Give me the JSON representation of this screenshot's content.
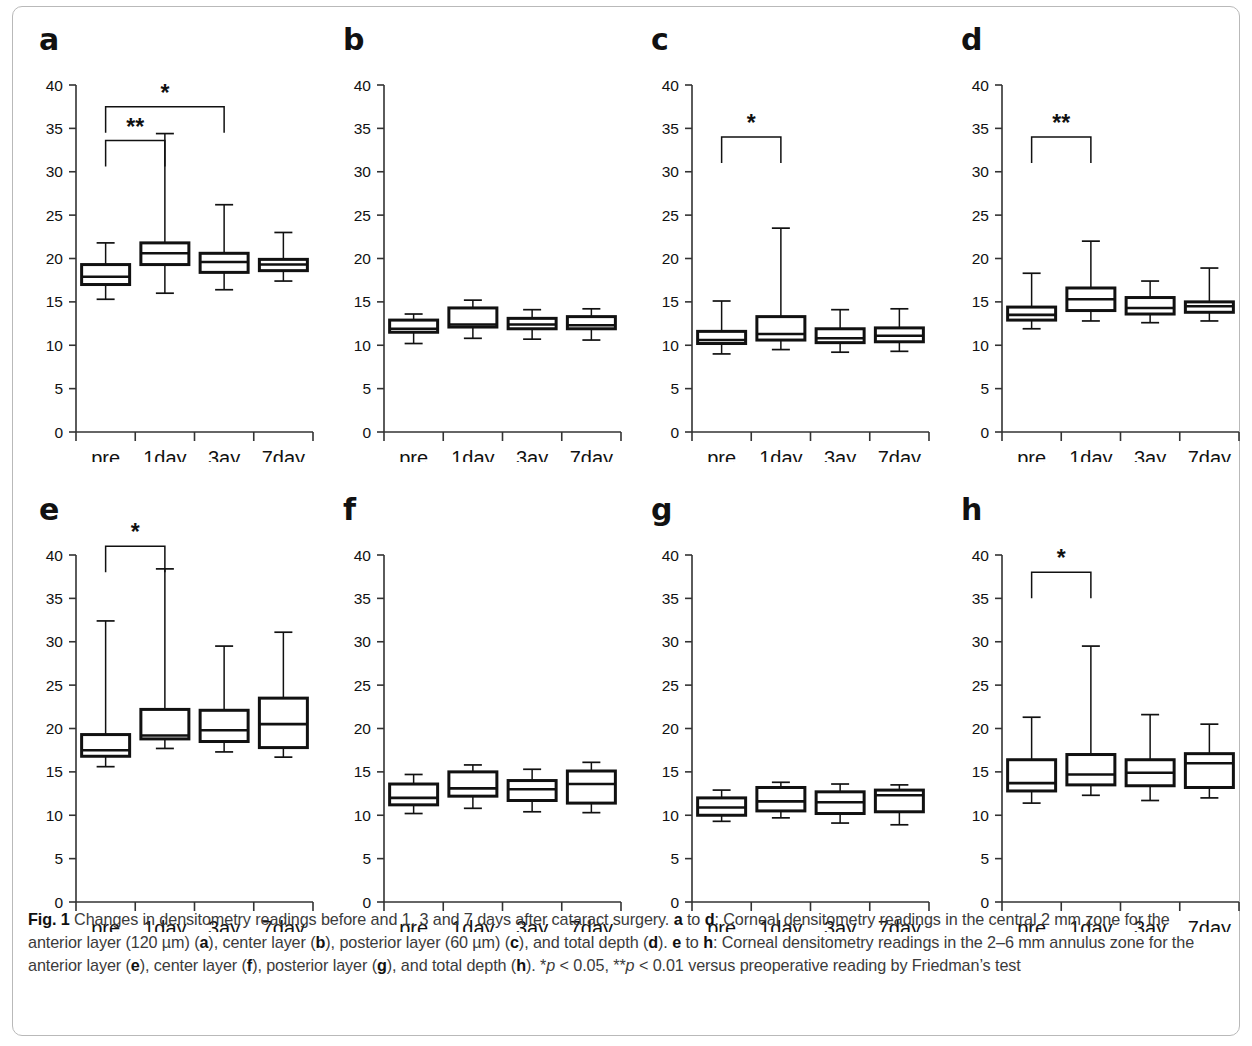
{
  "figure": {
    "label": "Fig. 1",
    "caption_parts": [
      {
        "t": "Fig. 1 ",
        "b": true
      },
      {
        "t": "Changes in densitometry readings before and 1, 3 and 7 days after cataract surgery. ",
        "b": false
      },
      {
        "t": "a",
        "b": true
      },
      {
        "t": " to ",
        "b": false
      },
      {
        "t": "d",
        "b": true
      },
      {
        "t": ": Corneal densitometry readings in the central 2 mm zone for the anterior layer (120 µm) (",
        "b": false
      },
      {
        "t": "a",
        "b": true
      },
      {
        "t": "), center layer (",
        "b": false
      },
      {
        "t": "b",
        "b": true
      },
      {
        "t": "), posterior layer (60 µm) (",
        "b": false
      },
      {
        "t": "c",
        "b": true
      },
      {
        "t": "), and total depth (",
        "b": false
      },
      {
        "t": "d",
        "b": true
      },
      {
        "t": "). ",
        "b": false
      },
      {
        "t": "e",
        "b": true
      },
      {
        "t": " to ",
        "b": false
      },
      {
        "t": "h",
        "b": true
      },
      {
        "t": ": Corneal densitometry readings in the 2–6 mm annulus zone for the anterior layer (",
        "b": false
      },
      {
        "t": "e",
        "b": true
      },
      {
        "t": "), center layer (",
        "b": false
      },
      {
        "t": "f",
        "b": true
      },
      {
        "t": "), posterior layer (",
        "b": false
      },
      {
        "t": "g",
        "b": true
      },
      {
        "t": "), and total depth (",
        "b": false
      },
      {
        "t": "h",
        "b": true
      },
      {
        "t": "). *",
        "b": false
      },
      {
        "t": "p",
        "b": false,
        "i": true
      },
      {
        "t": " < 0.05, **",
        "b": false
      },
      {
        "t": "p",
        "b": false,
        "i": true
      },
      {
        "t": " < 0.01 versus preoperative reading by Friedman’s test",
        "b": false
      }
    ],
    "caption_plain": "Fig. 1 Changes in densitometry readings before and 1, 3 and 7 days after cataract surgery. a to d: Corneal densitometry readings in the central 2 mm zone for the anterior layer (120 µm) (a), center layer (b), posterior layer (60 µm) (c), and total depth (d). e to h: Corneal densitometry readings in the 2–6 mm annulus zone for the anterior layer (e), center layer (f), posterior layer (g), and total depth (h). *p < 0.05, **p < 0.01 versus preoperative reading by Friedman’s test"
  },
  "chart_data": [
    {
      "type": "box",
      "panel": "a",
      "title": "Central 2 mm zone – anterior layer (120 µm)",
      "xlabel": "",
      "ylabel": "",
      "ylim": [
        0,
        40
      ],
      "yticks": [
        0,
        5,
        10,
        15,
        20,
        25,
        30,
        35,
        40
      ],
      "categories": [
        "pre",
        "1day",
        "3ay",
        "7day"
      ],
      "boxes": [
        {
          "category": "pre",
          "whisker_low": 15.3,
          "q1": 17.0,
          "median": 17.9,
          "q3": 19.3,
          "whisker_high": 21.8
        },
        {
          "category": "1day",
          "whisker_low": 16.0,
          "q1": 19.3,
          "median": 20.6,
          "q3": 21.8,
          "whisker_high": 34.4
        },
        {
          "category": "3ay",
          "whisker_low": 16.4,
          "q1": 18.4,
          "median": 19.6,
          "q3": 20.6,
          "whisker_high": 26.2
        },
        {
          "category": "7day",
          "whisker_low": 17.4,
          "q1": 18.6,
          "median": 19.3,
          "q3": 19.9,
          "whisker_high": 23.0
        }
      ],
      "significance": [
        {
          "from": "pre",
          "to": "3ay",
          "symbol": "*",
          "y": 37.5
        },
        {
          "from": "pre",
          "to": "1day",
          "symbol": "**",
          "y": 33.6
        }
      ]
    },
    {
      "type": "box",
      "panel": "b",
      "title": "Central 2 mm zone – center layer",
      "xlabel": "",
      "ylabel": "",
      "ylim": [
        0,
        40
      ],
      "yticks": [
        0,
        5,
        10,
        15,
        20,
        25,
        30,
        35,
        40
      ],
      "categories": [
        "pre",
        "1day",
        "3ay",
        "7day"
      ],
      "boxes": [
        {
          "category": "pre",
          "whisker_low": 10.2,
          "q1": 11.5,
          "median": 11.9,
          "q3": 12.9,
          "whisker_high": 13.6
        },
        {
          "category": "1day",
          "whisker_low": 10.8,
          "q1": 12.1,
          "median": 12.4,
          "q3": 14.3,
          "whisker_high": 15.2
        },
        {
          "category": "3ay",
          "whisker_low": 10.7,
          "q1": 11.9,
          "median": 12.4,
          "q3": 13.1,
          "whisker_high": 14.1
        },
        {
          "category": "7day",
          "whisker_low": 10.6,
          "q1": 11.9,
          "median": 12.3,
          "q3": 13.3,
          "whisker_high": 14.2
        }
      ],
      "significance": []
    },
    {
      "type": "box",
      "panel": "c",
      "title": "Central 2 mm zone – posterior layer (60 µm)",
      "xlabel": "",
      "ylabel": "",
      "ylim": [
        0,
        40
      ],
      "yticks": [
        0,
        5,
        10,
        15,
        20,
        25,
        30,
        35,
        40
      ],
      "categories": [
        "pre",
        "1day",
        "3ay",
        "7day"
      ],
      "boxes": [
        {
          "category": "pre",
          "whisker_low": 9.0,
          "q1": 10.2,
          "median": 10.6,
          "q3": 11.6,
          "whisker_high": 15.1
        },
        {
          "category": "1day",
          "whisker_low": 9.5,
          "q1": 10.6,
          "median": 11.3,
          "q3": 13.3,
          "whisker_high": 23.5
        },
        {
          "category": "3ay",
          "whisker_low": 9.2,
          "q1": 10.3,
          "median": 10.8,
          "q3": 11.9,
          "whisker_high": 14.1
        },
        {
          "category": "7day",
          "whisker_low": 9.3,
          "q1": 10.4,
          "median": 11.1,
          "q3": 12.0,
          "whisker_high": 14.2
        }
      ],
      "significance": [
        {
          "from": "pre",
          "to": "1day",
          "symbol": "*",
          "y": 34.0
        }
      ]
    },
    {
      "type": "box",
      "panel": "d",
      "title": "Central 2 mm zone – total depth",
      "xlabel": "",
      "ylabel": "",
      "ylim": [
        0,
        40
      ],
      "yticks": [
        0,
        5,
        10,
        15,
        20,
        25,
        30,
        35,
        40
      ],
      "categories": [
        "pre",
        "1day",
        "3ay",
        "7day"
      ],
      "boxes": [
        {
          "category": "pre",
          "whisker_low": 11.9,
          "q1": 12.9,
          "median": 13.5,
          "q3": 14.4,
          "whisker_high": 18.3
        },
        {
          "category": "1day",
          "whisker_low": 12.8,
          "q1": 14.0,
          "median": 15.3,
          "q3": 16.6,
          "whisker_high": 22.0
        },
        {
          "category": "3ay",
          "whisker_low": 12.6,
          "q1": 13.6,
          "median": 14.3,
          "q3": 15.5,
          "whisker_high": 17.4
        },
        {
          "category": "7day",
          "whisker_low": 12.8,
          "q1": 13.8,
          "median": 14.5,
          "q3": 15.0,
          "whisker_high": 18.9
        }
      ],
      "significance": [
        {
          "from": "pre",
          "to": "1day",
          "symbol": "**",
          "y": 34.0
        }
      ]
    },
    {
      "type": "box",
      "panel": "e",
      "title": "2–6 mm annulus zone – anterior layer",
      "xlabel": "",
      "ylabel": "",
      "ylim": [
        0,
        40
      ],
      "yticks": [
        0,
        5,
        10,
        15,
        20,
        25,
        30,
        35,
        40
      ],
      "categories": [
        "pre",
        "1day",
        "3ay",
        "7day"
      ],
      "boxes": [
        {
          "category": "pre",
          "whisker_low": 15.6,
          "q1": 16.8,
          "median": 17.5,
          "q3": 19.3,
          "whisker_high": 32.4
        },
        {
          "category": "1day",
          "whisker_low": 17.7,
          "q1": 18.8,
          "median": 19.2,
          "q3": 22.2,
          "whisker_high": 38.4
        },
        {
          "category": "3ay",
          "whisker_low": 17.3,
          "q1": 18.5,
          "median": 19.8,
          "q3": 22.1,
          "whisker_high": 29.5
        },
        {
          "category": "7day",
          "whisker_low": 16.7,
          "q1": 17.8,
          "median": 20.5,
          "q3": 23.5,
          "whisker_high": 31.1
        }
      ],
      "significance": [
        {
          "from": "pre",
          "to": "1day",
          "symbol": "*",
          "y": 41.0
        }
      ]
    },
    {
      "type": "box",
      "panel": "f",
      "title": "2–6 mm annulus zone – center layer",
      "xlabel": "",
      "ylabel": "",
      "ylim": [
        0,
        40
      ],
      "yticks": [
        0,
        5,
        10,
        15,
        20,
        25,
        30,
        35,
        40
      ],
      "categories": [
        "pre",
        "1day",
        "3ay",
        "7day"
      ],
      "boxes": [
        {
          "category": "pre",
          "whisker_low": 10.2,
          "q1": 11.2,
          "median": 12.0,
          "q3": 13.6,
          "whisker_high": 14.7
        },
        {
          "category": "1day",
          "whisker_low": 10.8,
          "q1": 12.2,
          "median": 13.1,
          "q3": 15.0,
          "whisker_high": 15.8
        },
        {
          "category": "3ay",
          "whisker_low": 10.4,
          "q1": 11.7,
          "median": 13.0,
          "q3": 14.0,
          "whisker_high": 15.3
        },
        {
          "category": "7day",
          "whisker_low": 10.3,
          "q1": 11.4,
          "median": 13.6,
          "q3": 15.1,
          "whisker_high": 16.1
        }
      ],
      "significance": []
    },
    {
      "type": "box",
      "panel": "g",
      "title": "2–6 mm annulus zone – posterior layer",
      "xlabel": "",
      "ylabel": "",
      "ylim": [
        0,
        40
      ],
      "yticks": [
        0,
        5,
        10,
        15,
        20,
        25,
        30,
        35,
        40
      ],
      "categories": [
        "pre",
        "1day",
        "3ay",
        "7day"
      ],
      "boxes": [
        {
          "category": "pre",
          "whisker_low": 9.3,
          "q1": 10.0,
          "median": 10.9,
          "q3": 12.0,
          "whisker_high": 12.9
        },
        {
          "category": "1day",
          "whisker_low": 9.7,
          "q1": 10.5,
          "median": 11.6,
          "q3": 13.2,
          "whisker_high": 13.8
        },
        {
          "category": "3ay",
          "whisker_low": 9.1,
          "q1": 10.2,
          "median": 11.5,
          "q3": 12.7,
          "whisker_high": 13.6
        },
        {
          "category": "7day",
          "whisker_low": 8.9,
          "q1": 10.4,
          "median": 12.3,
          "q3": 12.9,
          "whisker_high": 13.5
        }
      ],
      "significance": []
    },
    {
      "type": "box",
      "panel": "h",
      "title": "2–6 mm annulus zone – total depth",
      "xlabel": "",
      "ylabel": "",
      "ylim": [
        0,
        40
      ],
      "yticks": [
        0,
        5,
        10,
        15,
        20,
        25,
        30,
        35,
        40
      ],
      "categories": [
        "pre",
        "1day",
        "3ay",
        "7day"
      ],
      "boxes": [
        {
          "category": "pre",
          "whisker_low": 11.4,
          "q1": 12.8,
          "median": 13.7,
          "q3": 16.4,
          "whisker_high": 21.3
        },
        {
          "category": "1day",
          "whisker_low": 12.3,
          "q1": 13.5,
          "median": 14.7,
          "q3": 17.0,
          "whisker_high": 29.5
        },
        {
          "category": "3ay",
          "whisker_low": 11.7,
          "q1": 13.4,
          "median": 14.9,
          "q3": 16.4,
          "whisker_high": 21.6
        },
        {
          "category": "7day",
          "whisker_low": 12.0,
          "q1": 13.2,
          "median": 16.0,
          "q3": 17.1,
          "whisker_high": 20.5
        }
      ],
      "significance": [
        {
          "from": "pre",
          "to": "1day",
          "symbol": "*",
          "y": 38.0
        }
      ]
    }
  ]
}
